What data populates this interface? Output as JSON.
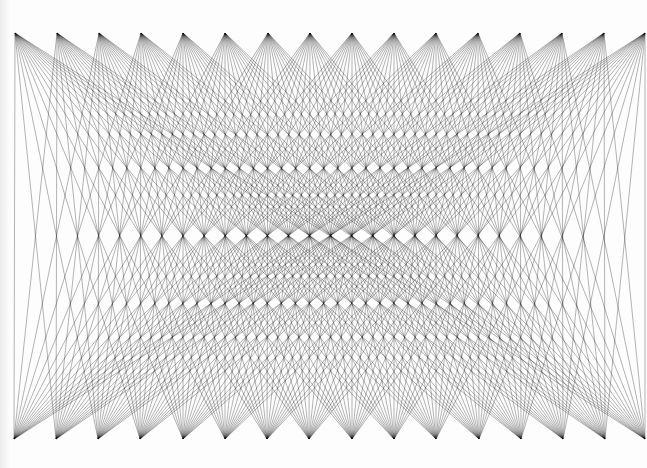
{
  "artwork": {
    "kind": "string-art",
    "background": "#ffffff",
    "line_color": "#000000",
    "top_row": {
      "y": 33,
      "x_points": [
        15,
        57,
        99,
        141,
        183,
        225,
        268,
        310,
        352,
        394,
        436,
        478,
        520,
        562,
        604,
        645
      ]
    },
    "bottom_row": {
      "y": 439,
      "x_points": [
        14,
        56,
        98,
        140,
        183,
        225,
        267,
        309,
        352,
        394,
        436,
        479,
        521,
        563,
        605,
        645
      ]
    },
    "connection": "each top point connects to every bottom point"
  }
}
